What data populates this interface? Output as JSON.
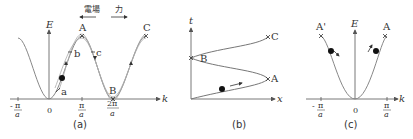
{
  "header": {
    "field_label": "電場",
    "force_label": "力"
  },
  "panel_a": {
    "caption": "(a)",
    "y_axis_label": "E",
    "x_axis_label": "k",
    "ticks": {
      "neg_pi": {
        "sign": "-",
        "num": "π",
        "den": "a"
      },
      "zero": "0",
      "pi": {
        "num": "π",
        "den": "a"
      },
      "two_pi": {
        "num": "2π",
        "den": "a"
      }
    },
    "points": {
      "A": "A",
      "B": "B",
      "C": "C",
      "a": "a",
      "b": "b",
      "c": "c"
    }
  },
  "panel_b": {
    "caption": "(b)",
    "y_axis_label": "t",
    "x_axis_label": "x",
    "points": {
      "A": "A",
      "B": "B",
      "C": "C"
    }
  },
  "panel_c": {
    "caption": "(c)",
    "y_axis_label": "E",
    "x_axis_label": "k",
    "ticks": {
      "neg_pi": {
        "sign": "-",
        "num": "π",
        "den": "a"
      },
      "zero": "0",
      "pi": {
        "num": "π",
        "den": "a"
      }
    },
    "points": {
      "A_prime": "A'",
      "A": "A"
    }
  },
  "colors": {
    "curve": "#888888",
    "axis": "#555555",
    "text": "#333333",
    "dot": "#111111"
  }
}
